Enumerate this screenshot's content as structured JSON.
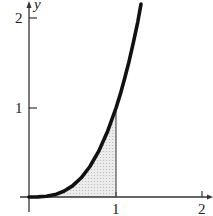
{
  "graph": {
    "function": "y = x^3",
    "shaded_region": "area under curve from x=0 to x=1",
    "x_axis": {
      "ticks": [
        "1",
        "2"
      ],
      "arrow": true
    },
    "y_axis": {
      "label": "y",
      "ticks": [
        "1",
        "2"
      ],
      "arrow": true
    },
    "colors": {
      "curve": "#111111",
      "axis": "#333333",
      "shade": "#d9d9d9"
    }
  }
}
